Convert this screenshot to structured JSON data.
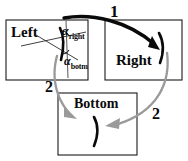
{
  "figure": {
    "title_number_1": "1",
    "panels": [
      {
        "id": "left",
        "label": "Left",
        "box": [
          6,
          20,
          82,
          60
        ]
      },
      {
        "id": "right",
        "label": "Right",
        "box": [
          105,
          20,
          77,
          60
        ]
      },
      {
        "id": "bottom",
        "label": "Bottom",
        "box": [
          58,
          93,
          79,
          62
        ]
      }
    ],
    "angle_annotations": [
      {
        "id": "alpha-right",
        "symbol": "α",
        "subscript": "right"
      },
      {
        "id": "alpha-botm",
        "symbol": "α",
        "subscript": "botm"
      }
    ],
    "step_labels": [
      {
        "id": "step-1",
        "text": "1",
        "arrow": "black-arrow-left-to-right"
      },
      {
        "id": "step-2-left",
        "text": "2",
        "arrow": "gray-arrow-left-to-bottom"
      },
      {
        "id": "step-2-right",
        "text": "2",
        "arrow": "gray-arrow-right-to-bottom"
      }
    ],
    "colors": {
      "stroke": "#0a0a0a",
      "box_border": "#1a1a1a",
      "gray_arrow": "#9a9a9a",
      "background": "#ffffff",
      "thin_line": "#2a2a2a"
    }
  }
}
